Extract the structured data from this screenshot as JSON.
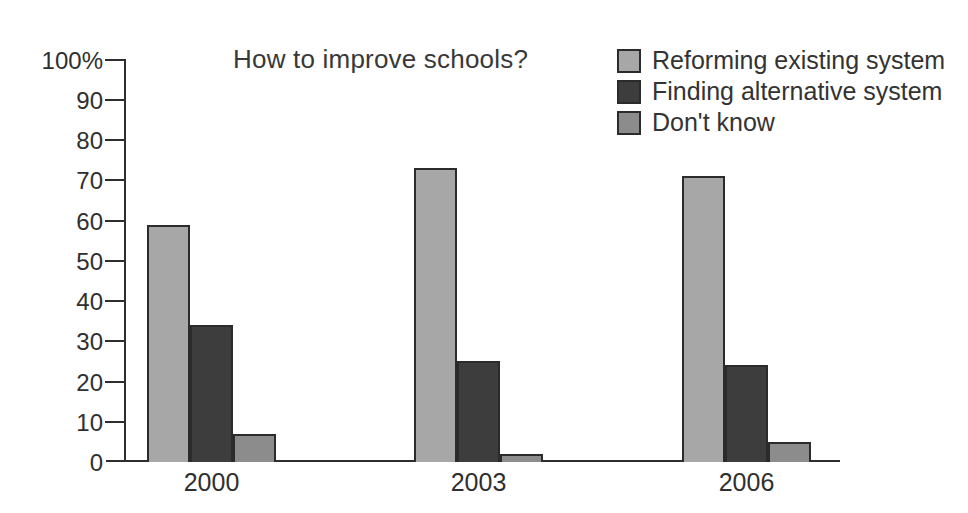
{
  "chart_data": {
    "type": "bar",
    "title": "How to improve schools?",
    "categories": [
      "2000",
      "2003",
      "2006"
    ],
    "series": [
      {
        "name": "Reforming existing system",
        "color": "#a7a7a7",
        "values": [
          59,
          73,
          71
        ]
      },
      {
        "name": "Finding alternative system",
        "color": "#3d3d3d",
        "values": [
          34,
          25,
          24
        ]
      },
      {
        "name": "Don't know",
        "color": "#8c8c8c",
        "values": [
          7,
          2,
          5
        ]
      }
    ],
    "xlabel": "",
    "ylabel": "",
    "ylim": [
      0,
      100
    ],
    "ytick_step": 10,
    "ytick_top_label": "100%",
    "grid": false,
    "legend_position": "top-right",
    "axis_color": "#2e2e2e",
    "bar_border_color": "#2b2b2b"
  }
}
